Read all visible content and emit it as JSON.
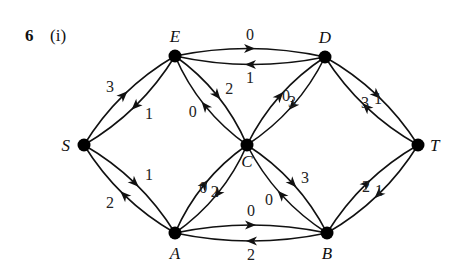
{
  "question": {
    "number": "6",
    "part": "(i)"
  },
  "colors": {
    "ink": "#111111",
    "node": "#000000",
    "background": "#ffffff"
  },
  "nodes": [
    {
      "id": "S",
      "label": "S",
      "x": 84,
      "y": 145
    },
    {
      "id": "E",
      "label": "E",
      "x": 175,
      "y": 56
    },
    {
      "id": "D",
      "label": "D",
      "x": 325,
      "y": 57
    },
    {
      "id": "C",
      "label": "C",
      "x": 247,
      "y": 145
    },
    {
      "id": "T",
      "label": "T",
      "x": 418,
      "y": 145
    },
    {
      "id": "A",
      "label": "A",
      "x": 175,
      "y": 233
    },
    {
      "id": "B",
      "label": "B",
      "x": 327,
      "y": 233
    }
  ],
  "edges": [
    {
      "from": "S",
      "to": "E",
      "weight": "3"
    },
    {
      "from": "E",
      "to": "S",
      "weight": "1"
    },
    {
      "from": "E",
      "to": "D",
      "weight": "0"
    },
    {
      "from": "D",
      "to": "E",
      "weight": "1"
    },
    {
      "from": "E",
      "to": "C",
      "weight": "2"
    },
    {
      "from": "C",
      "to": "E",
      "weight": "0"
    },
    {
      "from": "D",
      "to": "C",
      "weight": "0"
    },
    {
      "from": "C",
      "to": "D",
      "weight": "3"
    },
    {
      "from": "D",
      "to": "T",
      "weight": "3"
    },
    {
      "from": "T",
      "to": "D",
      "weight": "1"
    },
    {
      "from": "S",
      "to": "A",
      "weight": "1"
    },
    {
      "from": "A",
      "to": "S",
      "weight": "2"
    },
    {
      "from": "C",
      "to": "A",
      "weight": "0"
    },
    {
      "from": "A",
      "to": "C",
      "weight": "2"
    },
    {
      "from": "A",
      "to": "B",
      "weight": "0"
    },
    {
      "from": "B",
      "to": "A",
      "weight": "2"
    },
    {
      "from": "C",
      "to": "B",
      "weight": "3"
    },
    {
      "from": "B",
      "to": "C",
      "weight": "0"
    },
    {
      "from": "T",
      "to": "B",
      "weight": "2"
    },
    {
      "from": "B",
      "to": "T",
      "weight": "1"
    }
  ]
}
